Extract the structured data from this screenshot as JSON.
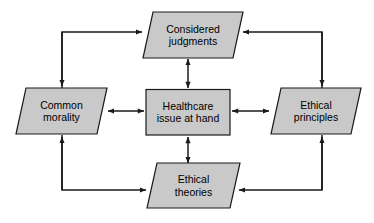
{
  "diagram": {
    "style": {
      "node_fill": "#c9c9c9",
      "node_stroke": "#1a1a1a",
      "arrow_color": "#1a1a1a",
      "background": "#ffffff"
    },
    "nodes": [
      {
        "id": "considered-judgments",
        "label": "Considered\njudgments",
        "shape": "parallelogram",
        "position": "top"
      },
      {
        "id": "common-morality",
        "label": "Common\nmorality",
        "shape": "parallelogram",
        "position": "left"
      },
      {
        "id": "healthcare-issue",
        "label": "Healthcare\nissue at hand",
        "shape": "rectangle",
        "position": "center"
      },
      {
        "id": "ethical-principles",
        "label": "Ethical\nprinciples",
        "shape": "parallelogram",
        "position": "right"
      },
      {
        "id": "ethical-theories",
        "label": "Ethical\ntheories",
        "shape": "parallelogram",
        "position": "bottom"
      }
    ],
    "connectors": [
      {
        "id": "center-to-considered-judgments",
        "from": "healthcare-issue",
        "to": "considered-judgments",
        "type": "double-arrow",
        "orientation": "vertical"
      },
      {
        "id": "center-to-common-morality",
        "from": "healthcare-issue",
        "to": "common-morality",
        "type": "double-arrow",
        "orientation": "horizontal"
      },
      {
        "id": "center-to-ethical-principles",
        "from": "healthcare-issue",
        "to": "ethical-principles",
        "type": "double-arrow",
        "orientation": "horizontal"
      },
      {
        "id": "center-to-ethical-theories",
        "from": "healthcare-issue",
        "to": "ethical-theories",
        "type": "double-arrow",
        "orientation": "vertical"
      },
      {
        "id": "elbow-top-left",
        "to": [
          "considered-judgments",
          "common-morality"
        ],
        "type": "elbow-branch",
        "corner": "top-left"
      },
      {
        "id": "elbow-top-right",
        "to": [
          "considered-judgments",
          "ethical-principles"
        ],
        "type": "elbow-branch",
        "corner": "top-right"
      },
      {
        "id": "elbow-bottom-left",
        "to": [
          "common-morality",
          "ethical-theories"
        ],
        "type": "elbow-branch",
        "corner": "bottom-left"
      },
      {
        "id": "elbow-bottom-right",
        "to": [
          "ethical-principles",
          "ethical-theories"
        ],
        "type": "elbow-branch",
        "corner": "bottom-right"
      }
    ]
  }
}
